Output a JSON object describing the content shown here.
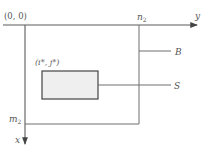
{
  "diagram": {
    "origin_label": "(0, 0)",
    "y_axis_label": "y",
    "x_axis_label": "x",
    "n2_label": "n",
    "n2_sub": "2",
    "m2_label": "m",
    "m2_sub": "2",
    "region_b_label": "B",
    "region_s_label": "S",
    "subregion_corner_label": "(i*, j*)",
    "colors": {
      "line": "#6e6e6e",
      "axis": "#5a5a5a",
      "s_fill": "#efefef",
      "s_stroke": "#444444",
      "text": "#555555"
    }
  }
}
